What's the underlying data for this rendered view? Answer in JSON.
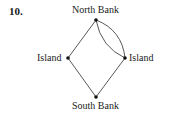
{
  "problem_number": "10.",
  "nodes": {
    "north": "North Bank",
    "west": "Island",
    "east": "Island",
    "south": "South Bank"
  },
  "edges": [
    {
      "from": "north",
      "to": "west"
    },
    {
      "from": "north",
      "to": "east"
    },
    {
      "from": "north",
      "to": "east"
    },
    {
      "from": "west",
      "to": "south"
    },
    {
      "from": "east",
      "to": "south"
    }
  ]
}
